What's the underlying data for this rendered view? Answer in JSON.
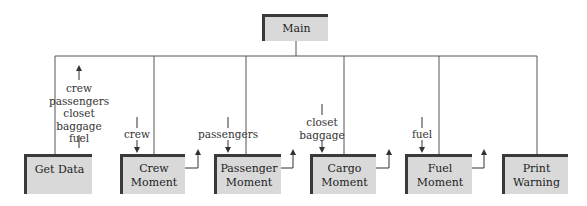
{
  "diagram": {
    "root": {
      "label": "Main"
    },
    "modules": [
      {
        "label": "Get Data",
        "flow_out": "crew\npassengers\ncloset\nbaggage\nfuel"
      },
      {
        "label": "Crew\nMoment",
        "flow_in": "crew"
      },
      {
        "label": "Passenger\nMoment",
        "flow_in": "passengers"
      },
      {
        "label": "Cargo\nMoment",
        "flow_in": "closet\nbaggage"
      },
      {
        "label": "Fuel\nMoment",
        "flow_in": "fuel"
      },
      {
        "label": "Print\nWarning"
      }
    ]
  },
  "colors": {
    "box_fill": "#d9d9d9",
    "box_border": "#3a3a3a",
    "line": "#555555"
  }
}
